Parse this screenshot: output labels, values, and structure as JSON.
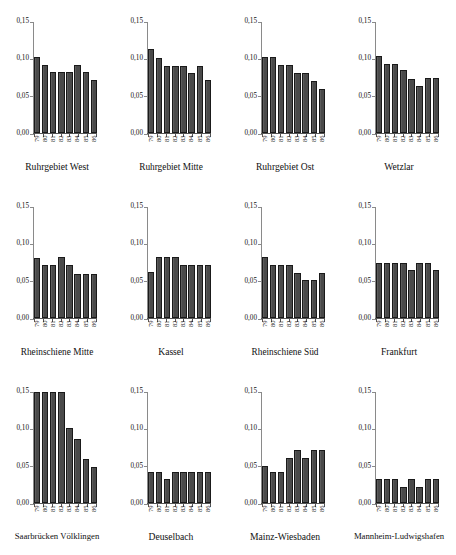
{
  "figure": {
    "layout": "3 rows x 4 columns of small multiple bar charts",
    "y_axis": {
      "tick_labels": [
        "0,00",
        "0,05",
        "0,10",
        "0,15"
      ],
      "tick_values": [
        0.0,
        0.05,
        0.1,
        0.15
      ],
      "min": 0.0,
      "max": 0.15
    },
    "x_axis": {
      "tick_labels": [
        "79",
        "80",
        "81",
        "82",
        "83",
        "84",
        "85",
        "86"
      ]
    },
    "bar_color": "#4a4a4a",
    "bar_edge_color": "#1a1a1a",
    "axis_color": "#8a8a8a"
  },
  "chart_data": [
    {
      "type": "bar",
      "title": "Ruhrgebiet West",
      "categories": [
        "79",
        "80",
        "81",
        "82",
        "83",
        "84",
        "85",
        "86"
      ],
      "values": [
        0.103,
        0.092,
        0.082,
        0.082,
        0.082,
        0.092,
        0.082,
        0.071
      ],
      "xlabel": "",
      "ylabel": "",
      "ylim": [
        0.0,
        0.15
      ],
      "yticks": [
        0.0,
        0.05,
        0.1,
        0.15
      ],
      "ytick_labels": [
        "0,00",
        "0,05",
        "0,10",
        "0,15"
      ],
      "grid": false,
      "legend": "none"
    },
    {
      "type": "bar",
      "title": "Ruhrgebiet Mitte",
      "categories": [
        "79",
        "80",
        "81",
        "82",
        "83",
        "84",
        "85",
        "86"
      ],
      "values": [
        0.113,
        0.102,
        0.091,
        0.091,
        0.091,
        0.081,
        0.091,
        0.071
      ],
      "xlabel": "",
      "ylabel": "",
      "ylim": [
        0.0,
        0.15
      ],
      "yticks": [
        0.0,
        0.05,
        0.1,
        0.15
      ],
      "ytick_labels": [
        "0,00",
        "0,05",
        "0,10",
        "0,15"
      ],
      "grid": false,
      "legend": "none"
    },
    {
      "type": "bar",
      "title": "Ruhrgebiet Ost",
      "categories": [
        "79",
        "80",
        "81",
        "82",
        "83",
        "84",
        "85",
        "86"
      ],
      "values": [
        0.103,
        0.103,
        0.092,
        0.092,
        0.081,
        0.081,
        0.07,
        0.06
      ],
      "xlabel": "",
      "ylabel": "",
      "ylim": [
        0.0,
        0.15
      ],
      "yticks": [
        0.0,
        0.05,
        0.1,
        0.15
      ],
      "ytick_labels": [
        "0,00",
        "0,05",
        "0,10",
        "0,15"
      ],
      "grid": false,
      "legend": "none"
    },
    {
      "type": "bar",
      "title": "Wetzlar",
      "categories": [
        "79",
        "80",
        "81",
        "82",
        "83",
        "84",
        "85",
        "86"
      ],
      "values": [
        0.104,
        0.093,
        0.093,
        0.085,
        0.073,
        0.063,
        0.074,
        0.074
      ],
      "xlabel": "",
      "ylabel": "",
      "ylim": [
        0.0,
        0.15
      ],
      "yticks": [
        0.0,
        0.05,
        0.1,
        0.15
      ],
      "ytick_labels": [
        "0,00",
        "0,05",
        "0,10",
        "0,15"
      ],
      "grid": false,
      "legend": "none"
    },
    {
      "type": "bar",
      "title": "Rheinschiene Mitte",
      "categories": [
        "79",
        "80",
        "81",
        "82",
        "83",
        "84",
        "85",
        "86"
      ],
      "values": [
        0.081,
        0.071,
        0.071,
        0.082,
        0.071,
        0.06,
        0.06,
        0.06
      ],
      "xlabel": "",
      "ylabel": "",
      "ylim": [
        0.0,
        0.15
      ],
      "yticks": [
        0.0,
        0.05,
        0.1,
        0.15
      ],
      "ytick_labels": [
        "0,00",
        "0,05",
        "0,10",
        "0,15"
      ],
      "grid": false,
      "legend": "none"
    },
    {
      "type": "bar",
      "title": "Kassel",
      "categories": [
        "79",
        "80",
        "81",
        "82",
        "83",
        "84",
        "85",
        "86"
      ],
      "values": [
        0.062,
        0.083,
        0.083,
        0.083,
        0.072,
        0.072,
        0.072,
        0.072
      ],
      "xlabel": "",
      "ylabel": "",
      "ylim": [
        0.0,
        0.15
      ],
      "yticks": [
        0.0,
        0.05,
        0.1,
        0.15
      ],
      "ytick_labels": [
        "0,00",
        "0,05",
        "0,10",
        "0,15"
      ],
      "grid": false,
      "legend": "none"
    },
    {
      "type": "bar",
      "title": "Rheinschiene Süd",
      "categories": [
        "79",
        "80",
        "81",
        "82",
        "83",
        "84",
        "85",
        "86"
      ],
      "values": [
        0.082,
        0.072,
        0.072,
        0.072,
        0.061,
        0.051,
        0.051,
        0.061
      ],
      "xlabel": "",
      "ylabel": "",
      "ylim": [
        0.0,
        0.15
      ],
      "yticks": [
        0.0,
        0.05,
        0.1,
        0.15
      ],
      "ytick_labels": [
        "0,00",
        "0,05",
        "0,10",
        "0,15"
      ],
      "grid": false,
      "legend": "none"
    },
    {
      "type": "bar",
      "title": "Frankfurt",
      "categories": [
        "79",
        "80",
        "81",
        "82",
        "83",
        "84",
        "85",
        "86"
      ],
      "values": [
        0.075,
        0.075,
        0.075,
        0.075,
        0.065,
        0.075,
        0.075,
        0.065
      ],
      "xlabel": "",
      "ylabel": "",
      "ylim": [
        0.0,
        0.15
      ],
      "yticks": [
        0.0,
        0.05,
        0.1,
        0.15
      ],
      "ytick_labels": [
        "0,00",
        "0,05",
        "0,10",
        "0,15"
      ],
      "grid": false,
      "legend": "none"
    },
    {
      "type": "bar",
      "title": "Saarbrücken Völklingen",
      "categories": [
        "79",
        "80",
        "81",
        "82",
        "83",
        "84",
        "85",
        "86"
      ],
      "values": [
        0.15,
        0.15,
        0.15,
        0.15,
        0.102,
        0.087,
        0.06,
        0.049
      ],
      "xlabel": "",
      "ylabel": "",
      "ylim": [
        0.0,
        0.15
      ],
      "yticks": [
        0.0,
        0.05,
        0.1,
        0.15
      ],
      "ytick_labels": [
        "0,00",
        "0,05",
        "0,10",
        "0,15"
      ],
      "grid": false,
      "legend": "none",
      "note": "first four bars reach or exceed the 0,15 axis maximum"
    },
    {
      "type": "bar",
      "title": "Deuselbach",
      "categories": [
        "79",
        "80",
        "81",
        "82",
        "83",
        "84",
        "85",
        "86"
      ],
      "values": [
        0.042,
        0.042,
        0.033,
        0.042,
        0.042,
        0.042,
        0.042,
        0.042
      ],
      "xlabel": "",
      "ylabel": "",
      "ylim": [
        0.0,
        0.15
      ],
      "yticks": [
        0.0,
        0.05,
        0.1,
        0.15
      ],
      "ytick_labels": [
        "0,00",
        "0,05",
        "0,10",
        "0,15"
      ],
      "grid": false,
      "legend": "none"
    },
    {
      "type": "bar",
      "title": "Mainz-Wiesbaden",
      "categories": [
        "79",
        "80",
        "81",
        "82",
        "83",
        "84",
        "85",
        "86"
      ],
      "values": [
        0.05,
        0.042,
        0.042,
        0.061,
        0.072,
        0.061,
        0.072,
        0.072
      ],
      "xlabel": "",
      "ylabel": "",
      "ylim": [
        0.0,
        0.15
      ],
      "yticks": [
        0.0,
        0.05,
        0.1,
        0.15
      ],
      "ytick_labels": [
        "0,00",
        "0,05",
        "0,10",
        "0,15"
      ],
      "grid": false,
      "legend": "none"
    },
    {
      "type": "bar",
      "title": "Mannheim-Ludwigshafen",
      "categories": [
        "79",
        "80",
        "81",
        "82",
        "83",
        "84",
        "85",
        "86"
      ],
      "values": [
        0.032,
        0.032,
        0.032,
        0.022,
        0.032,
        0.022,
        0.032,
        0.032
      ],
      "xlabel": "",
      "ylabel": "",
      "ylim": [
        0.0,
        0.15
      ],
      "yticks": [
        0.0,
        0.05,
        0.1,
        0.15
      ],
      "ytick_labels": [
        "0,00",
        "0,05",
        "0,10",
        "0,15"
      ],
      "grid": false,
      "legend": "none"
    }
  ]
}
